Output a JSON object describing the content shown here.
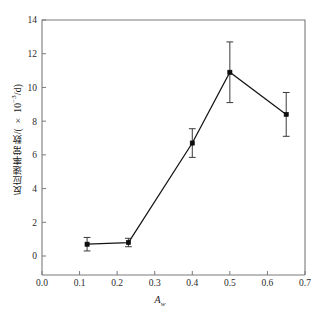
{
  "chart_data": {
    "type": "line",
    "title": "",
    "subtitle": "",
    "xlabel_main": "A",
    "xlabel_sub": "w",
    "ylabel_prefix": "反应速率常数/( × 10",
    "ylabel_exponent": "−3",
    "ylabel_suffix": "/d)",
    "ylabel_full": "反应速率常数/( × 10−3/d)",
    "x": [
      0.12,
      0.23,
      0.4,
      0.5,
      0.65
    ],
    "values": [
      0.7,
      0.8,
      6.7,
      10.9,
      8.4
    ],
    "yerr": [
      0.4,
      0.25,
      0.85,
      1.8,
      1.3
    ],
    "series": [
      {
        "name": "反应速率常数",
        "values": [
          0.7,
          0.8,
          6.7,
          10.9,
          8.4
        ]
      }
    ],
    "xlim": [
      0.0,
      0.7
    ],
    "ylim": [
      0,
      14
    ],
    "xticks": [
      0.0,
      0.1,
      0.2,
      0.3,
      0.4,
      0.5,
      0.6,
      0.7
    ],
    "xticklabels": [
      "0.0",
      "0.1",
      "0.2",
      "0.3",
      "0.4",
      "0.5",
      "0.6",
      "0.7"
    ],
    "yticks": [
      0,
      2,
      4,
      6,
      8,
      10,
      12,
      14
    ],
    "yticklabels": [
      "0",
      "2",
      "4",
      "6",
      "8",
      "10",
      "12",
      "14"
    ],
    "grid": false,
    "legend": null,
    "legend_position": "none",
    "marker": "filled-square",
    "line_color": "#141414",
    "marker_color": "#0d0d0d",
    "errorbar_color": "#3a3a3a",
    "axis_color": "#7a7a7a",
    "background_color": "#ffffff"
  }
}
